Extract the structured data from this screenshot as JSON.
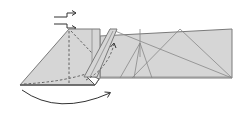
{
  "diagram": {
    "type": "origami-folding-step",
    "colors": {
      "paper": "#d6d6d6",
      "outline": "#7a7a7a",
      "crease": "#888888",
      "arrow": "#333333",
      "background": "#ffffff"
    },
    "symbols": [
      {
        "name": "push-arrows",
        "description": "two zig-zag push/sink arrows pointing right"
      },
      {
        "name": "curved-arrow-bottom",
        "description": "curved swing arrow under the left flap pointing right"
      },
      {
        "name": "dashed-fold-arrow",
        "description": "dashed curved arrow pointing up into the right flap"
      },
      {
        "name": "valley-fold-lines",
        "description": "dashed valley fold lines on the left triangle"
      }
    ],
    "regions": [
      {
        "name": "left-triangle-flap"
      },
      {
        "name": "long-strip"
      },
      {
        "name": "raised-flap"
      }
    ]
  }
}
